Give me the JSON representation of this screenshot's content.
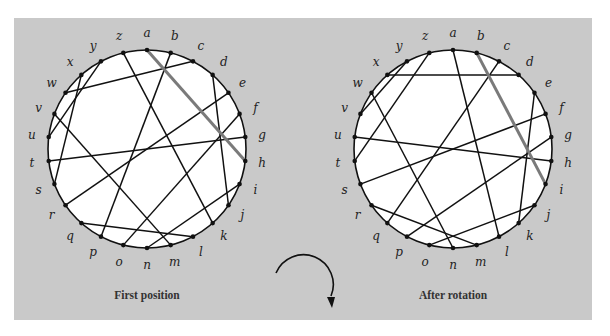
{
  "figure": {
    "panel_color": "#c9c9c9",
    "circle_fill": "#ffffff",
    "chord_color": "#111111",
    "highlight_color": "#7a7a7a",
    "points": [
      "a",
      "b",
      "c",
      "d",
      "e",
      "f",
      "g",
      "h",
      "i",
      "j",
      "k",
      "l",
      "m",
      "n",
      "o",
      "p",
      "q",
      "r",
      "s",
      "t",
      "u",
      "v",
      "w",
      "x",
      "y",
      "z"
    ],
    "arrow": {
      "direction": "clockwise",
      "label": ""
    }
  },
  "diagrams": [
    {
      "caption": "First position",
      "center": [
        147,
        149
      ],
      "radius": 99,
      "highlight_chord": [
        "a",
        "h"
      ],
      "chords": [
        [
          "b",
          "p"
        ],
        [
          "c",
          "w"
        ],
        [
          "d",
          "j"
        ],
        [
          "e",
          "r"
        ],
        [
          "f",
          "o"
        ],
        [
          "g",
          "t"
        ],
        [
          "i",
          "n"
        ],
        [
          "k",
          "z"
        ],
        [
          "l",
          "q"
        ],
        [
          "m",
          "v"
        ],
        [
          "s",
          "x"
        ],
        [
          "u",
          "y"
        ]
      ]
    },
    {
      "caption": "After rotation",
      "center": [
        453,
        149
      ],
      "radius": 99,
      "highlight_chord": [
        "b",
        "i"
      ],
      "chords": [
        [
          "a",
          "l"
        ],
        [
          "c",
          "q"
        ],
        [
          "d",
          "x"
        ],
        [
          "e",
          "k"
        ],
        [
          "f",
          "s"
        ],
        [
          "g",
          "p"
        ],
        [
          "h",
          "u"
        ],
        [
          "j",
          "o"
        ],
        [
          "m",
          "r"
        ],
        [
          "n",
          "w"
        ],
        [
          "t",
          "z"
        ],
        [
          "v",
          "y"
        ]
      ]
    }
  ]
}
